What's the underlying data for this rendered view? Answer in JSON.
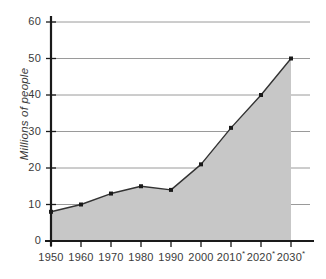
{
  "chart_data": {
    "type": "area",
    "title": "",
    "xlabel": "",
    "ylabel": "Millions of people",
    "categories": [
      "1950",
      "1960",
      "1970",
      "1980",
      "1990",
      "2000",
      "2010*",
      "2020*",
      "2030*"
    ],
    "values": [
      8,
      10,
      13,
      15,
      14,
      21,
      31,
      40,
      50
    ],
    "ylim": [
      0,
      60
    ],
    "yticks": [
      0,
      10,
      20,
      30,
      40,
      50,
      60
    ],
    "ytick_labels": [
      "0",
      "10",
      "20",
      "30",
      "40",
      "50",
      "60"
    ],
    "grid": true,
    "legend": null,
    "projected_marker": "*",
    "projected_categories": [
      "2010*",
      "2020*",
      "2030*"
    ],
    "series": [
      {
        "name": "Millions of people",
        "values": [
          8,
          10,
          13,
          15,
          14,
          21,
          31,
          40,
          50
        ]
      }
    ],
    "colors": {
      "area_fill": "#c7c7c7",
      "line": "#333333",
      "marker": "#1a1a1a",
      "grid": "#9a9a9a",
      "axis": "#1a1a1a",
      "text": "#3a3a3a",
      "background": "#ffffff"
    }
  }
}
